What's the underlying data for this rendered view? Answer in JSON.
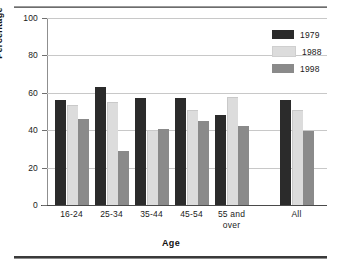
{
  "chart_data": {
    "type": "bar",
    "title": "",
    "xlabel": "Age",
    "ylabel": "Percentage",
    "categories": [
      "16-24",
      "25-34",
      "35-44",
      "45-54",
      "55 and over",
      "All"
    ],
    "category_lines": [
      [
        "16-24"
      ],
      [
        "25-34"
      ],
      [
        "35-44"
      ],
      [
        "45-54"
      ],
      [
        "55 and",
        "over"
      ],
      [
        "All"
      ]
    ],
    "series": [
      {
        "name": "1979",
        "color": "#2b2b2b",
        "values": [
          56,
          63,
          57,
          57,
          48,
          56
        ]
      },
      {
        "name": "1988",
        "color": "#dcdcdc",
        "values": [
          53.5,
          55,
          40,
          51,
          57.5,
          51
        ]
      },
      {
        "name": "1998",
        "color": "#8a8a8a",
        "values": [
          46,
          29,
          40.5,
          45,
          42.5,
          39.5
        ]
      }
    ],
    "ylim": [
      0,
      100
    ],
    "yticks": [
      0,
      20,
      40,
      60,
      80,
      100
    ],
    "ytick_labels": [
      "0",
      "20",
      "40",
      "60",
      "80",
      "100"
    ],
    "grid": true,
    "legend_position": "top-right"
  },
  "legend": {
    "entries": [
      {
        "label": "1979",
        "color": "#2b2b2b"
      },
      {
        "label": "1988",
        "color": "#dcdcdc"
      },
      {
        "label": "1998",
        "color": "#8a8a8a"
      }
    ]
  }
}
